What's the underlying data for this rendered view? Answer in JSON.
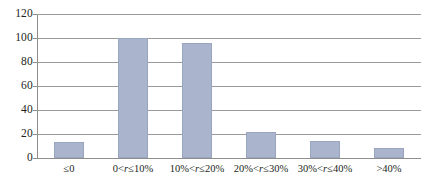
{
  "chart_data": {
    "type": "bar",
    "title": "",
    "subtitle": "",
    "xlabel": "",
    "ylabel": "",
    "categories": [
      "≤0",
      "0<r≤10%",
      "10%<r≤20%",
      "20%<r≤30%",
      "30%<r≤40%",
      ">40%"
    ],
    "values": [
      13,
      100,
      96,
      22,
      14,
      8
    ],
    "ylim": [
      0,
      120
    ],
    "yticks": [
      0,
      20,
      40,
      60,
      80,
      100,
      120
    ],
    "ytick_labels": [
      "0",
      "20",
      "40",
      "60",
      "80",
      "100",
      "120"
    ],
    "grid": "horizontal",
    "legend": "none",
    "series": [
      {
        "name": "",
        "values": [
          13,
          100,
          96,
          22,
          14,
          8
        ]
      }
    ],
    "colors": {
      "bar_fill": "#aab4cc",
      "bar_stroke": "#9aa5c0",
      "gridline": "#9a9a9a",
      "axis": "#8e8e8e",
      "text": "#231f20",
      "background": "#ffffff"
    }
  }
}
